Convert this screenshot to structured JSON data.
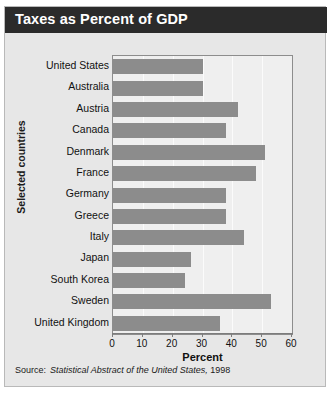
{
  "title": "Taxes as Percent of GDP",
  "source": {
    "label": "Source:",
    "publication": "Statistical Abstract of the United States,",
    "year": "1998"
  },
  "colors": {
    "title_bar": "#2b2b2b",
    "title_text": "#ffffff",
    "card_background": "#e7e7e7",
    "plot_background": "#efefef",
    "bar": "#8c8c8c",
    "gridline": "#fbfbfb",
    "axis": "#7c7c7c"
  },
  "chart_data": {
    "type": "bar",
    "orientation": "horizontal",
    "title": "Taxes as Percent of GDP",
    "xlabel": "Percent",
    "ylabel": "Selected countries",
    "xlim": [
      0,
      60
    ],
    "xticks": [
      0,
      10,
      20,
      30,
      40,
      50,
      60
    ],
    "grid": true,
    "legend": "none",
    "categories": [
      "United States",
      "Australia",
      "Austria",
      "Canada",
      "Denmark",
      "France",
      "Germany",
      "Greece",
      "Italy",
      "Japan",
      "South Korea",
      "Sweden",
      "United Kingdom"
    ],
    "values": [
      30,
      30,
      42,
      38,
      51,
      48,
      38,
      38,
      44,
      26,
      24,
      53,
      36
    ]
  }
}
